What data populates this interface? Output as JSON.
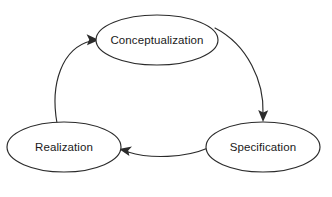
{
  "diagram": {
    "type": "cyclic-process-diagram",
    "background_color": "#ffffff",
    "node_fill_color": "#ffffff",
    "node_stroke_color": "#2b2b2b",
    "shadow_color": "#808080",
    "text_color": "#1a1a1a",
    "nodes": [
      {
        "id": "conceptualization",
        "label": "Conceptualization",
        "position": "top",
        "cx": 157,
        "cy": 40,
        "rx": 61,
        "ry": 25
      },
      {
        "id": "realization",
        "label": "Realization",
        "position": "left",
        "cx": 64,
        "cy": 147,
        "rx": 57,
        "ry": 25
      },
      {
        "id": "specification",
        "label": "Specification",
        "position": "right",
        "cx": 263,
        "cy": 147,
        "rx": 57,
        "ry": 25
      }
    ],
    "edges": [
      {
        "id": "realization-to-conceptualization",
        "from": "realization",
        "to": "conceptualization",
        "direction": "clockwise",
        "arrowhead": "at-target"
      },
      {
        "id": "conceptualization-to-specification",
        "from": "conceptualization",
        "to": "specification",
        "direction": "clockwise",
        "arrowhead": "at-target"
      },
      {
        "id": "specification-to-realization",
        "from": "specification",
        "to": "realization",
        "direction": "clockwise",
        "arrowhead": "at-target"
      }
    ]
  }
}
